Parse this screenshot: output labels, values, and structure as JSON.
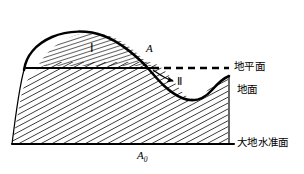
{
  "figure": {
    "title": "",
    "background_color": "#ffffff",
    "stroke_color": "#000000",
    "labels": {
      "horizontal_plane": "地平面",
      "ground_surface": "地面",
      "geoid": "大地水准面",
      "point_a": "A",
      "point_a0_letter": "A",
      "point_a0_subscript": "0",
      "zone_one": "Ⅰ",
      "zone_two": "Ⅱ"
    },
    "icons": {
      "leader_arrow": "arrow-right-icon",
      "dashed_line": "dashed-line-icon",
      "hatch_fill": "diagonal-hatch-icon"
    },
    "geometry": {
      "baseline_y": 144,
      "horizontal_plane_y": 68,
      "hill_crest_y": 33,
      "valley_bottom_y": 101,
      "left_edge_x": 12,
      "right_edge_x": 228,
      "dashed_line_start_x": 152,
      "dashed_line_end_x": 228
    }
  }
}
